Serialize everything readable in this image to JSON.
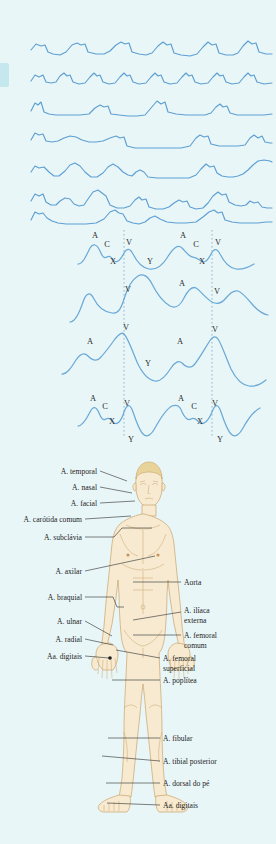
{
  "figure": {
    "background_color": "#e9f6f8",
    "trace_color": "#5d9fd2",
    "skin_color": "#f7ead0",
    "outline_color": "#c9a36a"
  },
  "pressure_panel": {
    "name": "pressure-waveform-panel",
    "trace_count": 7,
    "traces": [
      {
        "id": "trace-1",
        "label": ""
      },
      {
        "id": "trace-2",
        "label": ""
      },
      {
        "id": "trace-3",
        "label": ""
      },
      {
        "id": "trace-4",
        "label": ""
      },
      {
        "id": "trace-5",
        "label": ""
      },
      {
        "id": "trace-6",
        "label": ""
      },
      {
        "id": "trace-7",
        "label": ""
      }
    ]
  },
  "jvp_panel": {
    "name": "jugular-venous-pulse-panel",
    "trace_count": 4,
    "wave_labels": {
      "a": "A",
      "c": "C",
      "v": "V",
      "x": "X",
      "y": "Y"
    },
    "traces": [
      {
        "id": "jvp-trace-1",
        "marks": [
          {
            "text": "A",
            "x": 95,
            "y": 12
          },
          {
            "text": "C",
            "x": 107,
            "y": 21
          },
          {
            "text": "V",
            "x": 129,
            "y": 19
          },
          {
            "text": "X",
            "x": 113,
            "y": 38
          },
          {
            "text": "Y",
            "x": 150,
            "y": 38
          },
          {
            "text": "A",
            "x": 183,
            "y": 12
          },
          {
            "text": "C",
            "x": 196,
            "y": 21
          },
          {
            "text": "V",
            "x": 218,
            "y": 19
          },
          {
            "text": "X",
            "x": 202,
            "y": 38
          }
        ]
      },
      {
        "id": "jvp-trace-2",
        "marks": [
          {
            "text": "V",
            "x": 128,
            "y": 10
          },
          {
            "text": "A",
            "x": 182,
            "y": 7
          },
          {
            "text": "V",
            "x": 217,
            "y": 12
          }
        ]
      },
      {
        "id": "jvp-trace-3",
        "marks": [
          {
            "text": "V",
            "x": 126,
            "y": 8
          },
          {
            "text": "A",
            "x": 90,
            "y": 22
          },
          {
            "text": "A",
            "x": 180,
            "y": 22
          },
          {
            "text": "V",
            "x": 215,
            "y": 10
          },
          {
            "text": "Y",
            "x": 148,
            "y": 44
          }
        ]
      },
      {
        "id": "jvp-trace-4",
        "marks": [
          {
            "text": "A",
            "x": 93,
            "y": 10
          },
          {
            "text": "C",
            "x": 105,
            "y": 18
          },
          {
            "text": "V",
            "x": 127,
            "y": 15
          },
          {
            "text": "X",
            "x": 112,
            "y": 33
          },
          {
            "text": "Y",
            "x": 131,
            "y": 51
          },
          {
            "text": "A",
            "x": 181,
            "y": 10
          },
          {
            "text": "C",
            "x": 194,
            "y": 18
          },
          {
            "text": "V",
            "x": 215,
            "y": 15
          },
          {
            "text": "X",
            "x": 200,
            "y": 33
          },
          {
            "text": "Y",
            "x": 220,
            "y": 51
          }
        ]
      }
    ],
    "guide_lines": [
      {
        "id": "guide-left",
        "x": 124
      },
      {
        "id": "guide-right",
        "x": 212
      }
    ]
  },
  "anatomy_panel": {
    "name": "arterial-anatomy-diagram",
    "left_labels": [
      {
        "id": "a-temporal",
        "text": "A. temporal",
        "tx": 97,
        "ty": 22,
        "lx1": 100,
        "ly1": 19,
        "lx2": 127,
        "ly2": 29
      },
      {
        "id": "a-nasal",
        "text": "A. nasal",
        "tx": 97,
        "ty": 38,
        "lx1": 100,
        "ly1": 35,
        "lx2": 130,
        "ly2": 41
      },
      {
        "id": "a-facial",
        "text": "A. facial",
        "tx": 97,
        "ty": 54,
        "lx1": 100,
        "ly1": 51,
        "lx2": 133,
        "ly2": 49
      },
      {
        "id": "a-carotida",
        "text": "A. carótida comum",
        "tx": 82,
        "ty": 70,
        "lx1": 85,
        "ly1": 67,
        "lx2": 131,
        "ly2": 64
      },
      {
        "id": "a-subclavia",
        "text": "A. subclávia",
        "tx": 82,
        "ty": 88,
        "lx1": 85,
        "ly1": 85,
        "lx2": 122,
        "ly2": 76
      },
      {
        "id": "a-axilar",
        "text": "A. axilar",
        "tx": 82,
        "ty": 122,
        "lx1": 85,
        "ly1": 119,
        "lx2": 141,
        "ly2": 110
      },
      {
        "id": "a-braquial",
        "text": "A. braquial",
        "tx": 82,
        "ty": 148,
        "lx1": 85,
        "ly1": 145,
        "lx2": 119,
        "ly2": 145
      },
      {
        "id": "a-ulnar",
        "text": "A. ulnar",
        "tx": 82,
        "ty": 172,
        "lx1": 85,
        "ly1": 169,
        "lx2": 111,
        "ly2": 180
      },
      {
        "id": "a-radial",
        "text": "A. radial",
        "tx": 82,
        "ty": 190,
        "lx1": 85,
        "ly1": 187,
        "lx2": 113,
        "ly2": 193
      },
      {
        "id": "aa-digitais-m",
        "text": "Aa. digitais",
        "tx": 82,
        "ty": 207,
        "lx1": 85,
        "ly1": 204,
        "lx2": 110,
        "ly2": 207
      }
    ],
    "right_labels": [
      {
        "id": "aorta",
        "text": "Aorta",
        "tx": 184,
        "ty": 133,
        "lx1": 181,
        "ly1": 130,
        "lx2": 141,
        "ly2": 130
      },
      {
        "id": "a-iliaca-externa",
        "text": "A. ilíaca",
        "text2": "externa",
        "tx": 184,
        "ty": 161,
        "tx2": 184,
        "ty2": 171,
        "lx1": 181,
        "ly1": 158,
        "lx2": 140,
        "ly2": 164
      },
      {
        "id": "a-femoral-comum",
        "text": "A. femoral",
        "text2": "comum",
        "tx": 184,
        "ty": 184,
        "tx2": 184,
        "ty2": 194,
        "lx1": 181,
        "ly1": 181,
        "lx2": 134,
        "ly2": 181
      },
      {
        "id": "a-femoral-superficial",
        "text": "A. femoral",
        "text2": "superficial",
        "tx": 163,
        "ty": 207,
        "tx2": 163,
        "ty2": 217,
        "lx1": 160,
        "ly1": 204,
        "lx2": 118,
        "ly2": 196
      },
      {
        "id": "a-poplitea",
        "text": "A. poplítea",
        "tx": 163,
        "ty": 229,
        "lx1": 160,
        "ly1": 226,
        "lx2": 112,
        "ly2": 226
      },
      {
        "id": "a-fibular",
        "text": "A. fibular",
        "tx": 163,
        "ty": 288,
        "lx1": 160,
        "ly1": 285,
        "lx2": 108,
        "ly2": 285
      },
      {
        "id": "a-tibial-posterior",
        "text": "A. tibial posterior",
        "tx": 163,
        "ty": 311,
        "lx1": 160,
        "ly1": 308,
        "lx2": 100,
        "ly2": 303
      },
      {
        "id": "a-dorsal-do-pe",
        "text": "A. dorsal do pé",
        "tx": 163,
        "ty": 333,
        "lx1": 160,
        "ly1": 330,
        "lx2": 104,
        "ly2": 330
      },
      {
        "id": "aa-digitais-p",
        "text": "Aa. digitais",
        "tx": 163,
        "ty": 355,
        "lx1": 160,
        "ly1": 352,
        "lx2": 105,
        "ly2": 350
      }
    ]
  }
}
